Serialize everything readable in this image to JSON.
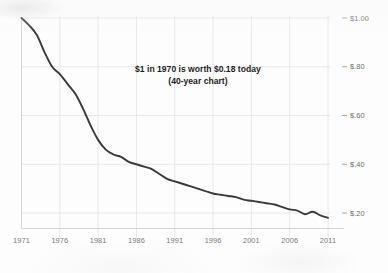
{
  "chart_data": {
    "type": "line",
    "title": "",
    "subtitle": "",
    "annotation_line1": "$1 in 1970 is worth $0.18 today",
    "annotation_line2": "(40-year chart)",
    "xlabel": "",
    "ylabel": "",
    "xlim": [
      1971,
      2011
    ],
    "ylim": [
      0.12,
      1.0
    ],
    "grid": true,
    "legend_position": "none",
    "y_axis_position": "right",
    "line_color": "#3a3a3a",
    "grid_color": "#e2e2e2",
    "background_color": "#fdfdfd",
    "x_tick_labels": [
      "1971",
      "1976",
      "1981",
      "1986",
      "1991",
      "1996",
      "2001",
      "2006",
      "2011"
    ],
    "x_tick_values": [
      1971,
      1976,
      1981,
      1986,
      1991,
      1996,
      2001,
      2006,
      2011
    ],
    "y_tick_labels": [
      "$1.00",
      "$.80",
      "$.60",
      "$.40",
      "$.20"
    ],
    "y_tick_values": [
      1.0,
      0.8,
      0.6,
      0.4,
      0.2
    ],
    "series": [
      {
        "name": "Purchasing power of $1 (1970 dollars)",
        "x": [
          1971,
          1972,
          1973,
          1974,
          1975,
          1976,
          1977,
          1978,
          1979,
          1980,
          1981,
          1982,
          1983,
          1984,
          1985,
          1986,
          1987,
          1988,
          1989,
          1990,
          1991,
          1992,
          1993,
          1994,
          1995,
          1996,
          1997,
          1998,
          1999,
          2000,
          2001,
          2002,
          2003,
          2004,
          2005,
          2006,
          2007,
          2008,
          2009,
          2010,
          2011
        ],
        "values": [
          1.0,
          0.97,
          0.93,
          0.86,
          0.8,
          0.77,
          0.73,
          0.69,
          0.63,
          0.56,
          0.5,
          0.46,
          0.44,
          0.43,
          0.41,
          0.4,
          0.39,
          0.38,
          0.36,
          0.34,
          0.33,
          0.32,
          0.31,
          0.3,
          0.29,
          0.28,
          0.275,
          0.27,
          0.265,
          0.255,
          0.25,
          0.245,
          0.24,
          0.235,
          0.225,
          0.215,
          0.21,
          0.195,
          0.205,
          0.19,
          0.18
        ]
      }
    ]
  }
}
